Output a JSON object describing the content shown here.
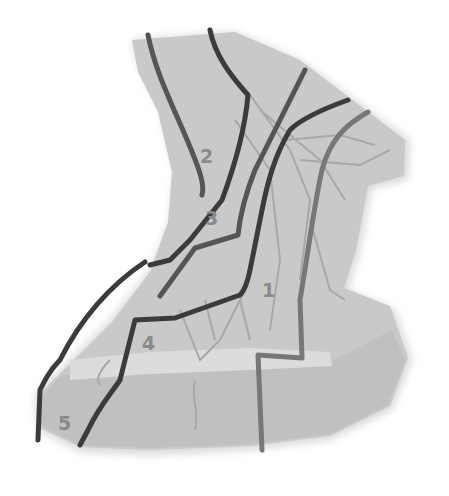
{
  "diagram": {
    "colors": {
      "background": "#ffffff",
      "neck_fill": "#c9c9c9",
      "neck_shadow": "#b8b8b8",
      "clavicle_band": "#dedede",
      "chest_fill": "#c2c2c2",
      "muscle_lines": "#a9a9a9",
      "line_dark": "#3b3b3b",
      "line_medium": "#555555",
      "line_light": "#777777",
      "label_color": "#8a8a8a"
    },
    "labels": [
      {
        "id": "region-1",
        "text": "1",
        "x": 262,
        "y": 297
      },
      {
        "id": "region-2",
        "text": "2",
        "x": 200,
        "y": 163
      },
      {
        "id": "region-3",
        "text": "3",
        "x": 205,
        "y": 225
      },
      {
        "id": "region-4",
        "text": "4",
        "x": 142,
        "y": 350
      },
      {
        "id": "region-5",
        "text": "5",
        "x": 58,
        "y": 430
      }
    ]
  }
}
